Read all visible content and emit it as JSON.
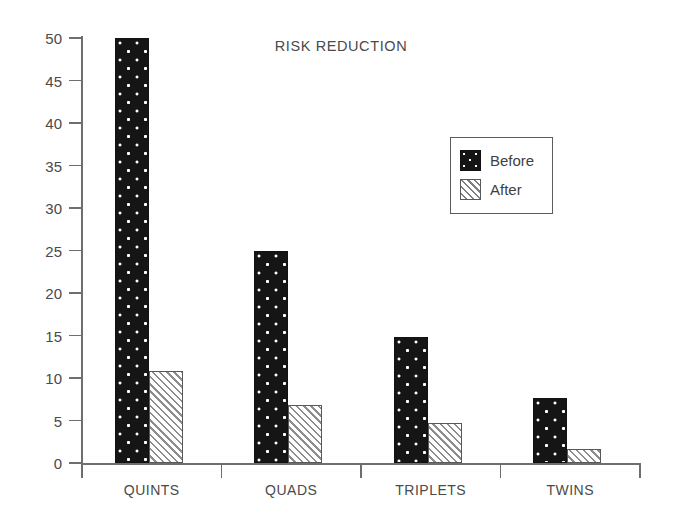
{
  "chart_data": {
    "type": "bar",
    "title": "RISK REDUCTION",
    "xlabel": "",
    "ylabel": "",
    "categories": [
      "QUINTS",
      "QUADS",
      "TRIPLETS",
      "TWINS"
    ],
    "series": [
      {
        "name": "Before",
        "values": [
          50,
          25,
          14.8,
          7.6
        ],
        "pattern": "black-dotted",
        "color": "#151515"
      },
      {
        "name": "After",
        "values": [
          10.8,
          6.8,
          4.7,
          1.7
        ],
        "pattern": "white-diagonal-hatch",
        "color": "#ffffff"
      }
    ],
    "ylim": [
      0,
      50
    ],
    "yticks": [
      0,
      5,
      10,
      15,
      20,
      25,
      30,
      35,
      40,
      45,
      50
    ],
    "ytick_labels": [
      "0",
      "5",
      "10",
      "15",
      "20",
      "25",
      "30",
      "35",
      "40",
      "45",
      "50"
    ],
    "grid": false,
    "legend_position": "upper-right-inside",
    "legend_entries": [
      "Before",
      "After"
    ]
  },
  "axis": {
    "line_color": "#6e6e6e",
    "label_color": "#4a4a4a"
  },
  "legend": {
    "rows": [
      {
        "label": "Before"
      },
      {
        "label": "After"
      }
    ]
  }
}
